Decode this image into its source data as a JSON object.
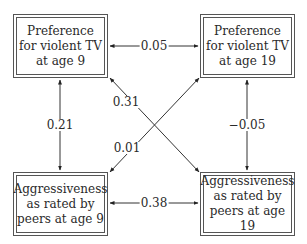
{
  "nodes": {
    "tv9": {
      "label": "Preference for violent TV at age 9"
    },
    "tv19": {
      "label": "Preference for violent TV at age 19"
    },
    "agg9": {
      "label": "Aggressiveness as rated by peers at age 9"
    },
    "agg19": {
      "label": "Aggressiveness as rated by peers at age 19"
    }
  },
  "edges": [
    {
      "from": "tv9",
      "to": "tv19",
      "label": "0.05",
      "direction": "both"
    },
    {
      "from": "agg9",
      "to": "agg19",
      "label": "0.38",
      "direction": "both"
    },
    {
      "from": "tv9",
      "to": "agg9",
      "label": "0.21",
      "direction": "both"
    },
    {
      "from": "tv19",
      "to": "agg19",
      "label": "−0.05",
      "direction": "both"
    },
    {
      "from": "tv9",
      "to": "agg19",
      "label": "0.31",
      "direction": "both"
    },
    {
      "from": "agg9",
      "to": "tv19",
      "label": "0.01",
      "direction": "both"
    }
  ]
}
